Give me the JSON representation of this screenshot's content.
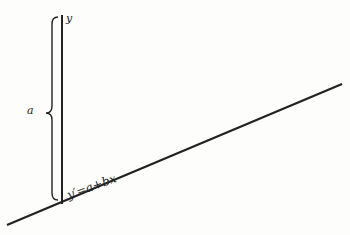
{
  "diagram": {
    "labels": {
      "y_axis": "y",
      "intercept": "a",
      "equation": "y′=a+bx"
    },
    "colors": {
      "background": "#fdfdfb",
      "stroke": "#222222"
    },
    "elements": {
      "vertical_axis": {
        "x": 62,
        "y_top": 15,
        "y_bottom": 204
      },
      "regression_line": {
        "x1": 7,
        "y1": 225,
        "x2": 342,
        "y2": 84
      },
      "brace": {
        "x": 52,
        "y_top": 17,
        "y_mid": 113,
        "y_bottom": 200,
        "opens": "right"
      }
    }
  }
}
